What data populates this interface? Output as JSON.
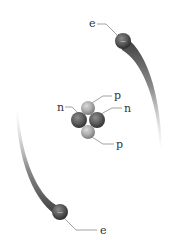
{
  "diagram": {
    "background": "#ffffff",
    "electrons": [
      {
        "id": "electron-top",
        "label": "e",
        "sign": "−",
        "cx": 123,
        "cy": 41,
        "r": 8,
        "label_x": 89,
        "label_y": 26
      },
      {
        "id": "electron-bottom",
        "label": "e",
        "sign": "−",
        "cx": 60,
        "cy": 212,
        "r": 8,
        "label_x": 100,
        "label_y": 233
      }
    ],
    "nucleus": {
      "protons": [
        {
          "id": "proton-top",
          "label": "p",
          "sign": "+",
          "cx": 88,
          "cy": 108,
          "r": 7,
          "label_x": 114,
          "label_y": 99
        },
        {
          "id": "proton-bottom",
          "label": "p",
          "sign": "+",
          "cx": 88,
          "cy": 132,
          "r": 7,
          "label_x": 116,
          "label_y": 147
        }
      ],
      "neutrons": [
        {
          "id": "neutron-left",
          "label": "n",
          "cx": 79,
          "cy": 120,
          "r": 8,
          "label_x": 58,
          "label_y": 110
        },
        {
          "id": "neutron-right",
          "label": "n",
          "cx": 97,
          "cy": 120,
          "r": 8,
          "label_x": 124,
          "label_y": 111
        }
      ]
    },
    "colors": {
      "electron": "#555555",
      "neutron": "#5a5a5a",
      "proton": "#a8a8a8",
      "label": "#333333",
      "leader": "#8a8a8a",
      "trail": "#3a3a3a"
    }
  }
}
